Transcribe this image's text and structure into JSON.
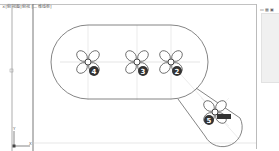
{
  "window": {
    "title": "×[俯视图]俯视 [二维线框]"
  },
  "right_panel": {
    "icons_label": "▭ ▦ ▣",
    "list_items": []
  },
  "drawing": {
    "badges": [
      {
        "id": "4",
        "label": "4"
      },
      {
        "id": "3",
        "label": "3"
      },
      {
        "id": "2",
        "label": "2"
      },
      {
        "id": "5",
        "label": "5"
      }
    ],
    "axis": {
      "y_label": "Y",
      "x_label": "X"
    },
    "side_marker": "◻"
  },
  "colors": {
    "line": "#555555",
    "badge_bg": "#333333",
    "centerline": "#b0b0b0",
    "panel_bg": "#f0f0f0"
  }
}
